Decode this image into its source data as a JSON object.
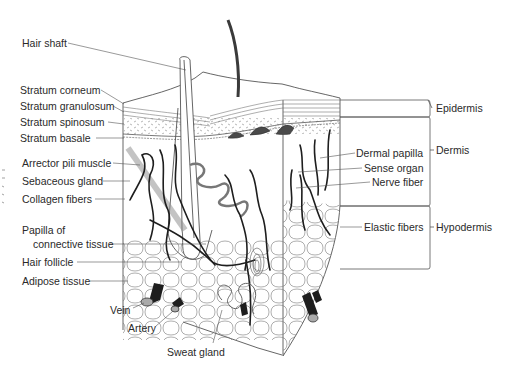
{
  "diagram": {
    "colors": {
      "line": "#555555",
      "vessel": "#1e1e1e",
      "hair": "#3a3a3a",
      "papilla_fill": "#4a4a4a",
      "text": "#2a2a2a"
    },
    "left_labels": [
      {
        "id": "hair-shaft",
        "text": "Hair shaft",
        "x": 22,
        "y": 43
      },
      {
        "id": "stratum-corneum",
        "text": "Stratum corneum",
        "x": 20,
        "y": 86
      },
      {
        "id": "stratum-granulosum",
        "text": "Stratum granulosum",
        "x": 20,
        "y": 102
      },
      {
        "id": "stratum-spinosum",
        "text": "Stratum spinosum",
        "x": 20,
        "y": 118
      },
      {
        "id": "stratum-basale",
        "text": "Stratum basale",
        "x": 20,
        "y": 134
      },
      {
        "id": "arrector-pili-muscle",
        "text": "Arrector pili muscle",
        "x": 22,
        "y": 159
      },
      {
        "id": "sebaceous-gland",
        "text": "Sebaceous gland",
        "x": 22,
        "y": 177
      },
      {
        "id": "collagen-fibers",
        "text": "Collagen fibers",
        "x": 22,
        "y": 195
      },
      {
        "id": "papilla-line1",
        "text": "Papilla of",
        "x": 22,
        "y": 226
      },
      {
        "id": "papilla-line2",
        "text": "connective tissue",
        "x": 33,
        "y": 240
      },
      {
        "id": "hair-follicle",
        "text": "Hair follicle",
        "x": 22,
        "y": 258
      },
      {
        "id": "adipose-tissue",
        "text": "Adipose tissue",
        "x": 22,
        "y": 277
      },
      {
        "id": "vein",
        "text": "Vein",
        "x": 110,
        "y": 306
      },
      {
        "id": "artery",
        "text": "Artery",
        "x": 128,
        "y": 324
      },
      {
        "id": "sweat-gland",
        "text": "Sweat gland",
        "x": 167,
        "y": 348
      }
    ],
    "right_labels": [
      {
        "id": "dermal-papilla",
        "text": "Dermal papilla",
        "x": 356,
        "y": 149
      },
      {
        "id": "sense-organ",
        "text": "Sense organ",
        "x": 364,
        "y": 164
      },
      {
        "id": "nerve-fiber",
        "text": "Nerve fiber",
        "x": 372,
        "y": 178
      },
      {
        "id": "elastic-fibers",
        "text": "Elastic fibers",
        "x": 364,
        "y": 223
      }
    ],
    "layer_labels": [
      {
        "id": "epidermis",
        "text": "Epidermis",
        "x": 436,
        "y": 102
      },
      {
        "id": "dermis",
        "text": "Dermis",
        "x": 436,
        "y": 146
      },
      {
        "id": "hypodermis",
        "text": "Hypodermis",
        "x": 436,
        "y": 223
      }
    ]
  }
}
